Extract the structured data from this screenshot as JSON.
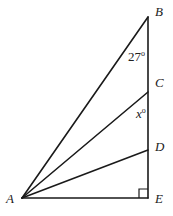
{
  "diagram": {
    "type": "geometry",
    "points": {
      "A": {
        "label": "A",
        "x": 22,
        "y": 198
      },
      "B": {
        "label": "B",
        "x": 148,
        "y": 17
      },
      "C": {
        "label": "C",
        "x": 148,
        "y": 92
      },
      "D": {
        "label": "D",
        "x": 148,
        "y": 150
      },
      "E": {
        "label": "E",
        "x": 148,
        "y": 198
      }
    },
    "segments": [
      {
        "from": "A",
        "to": "B"
      },
      {
        "from": "A",
        "to": "C"
      },
      {
        "from": "A",
        "to": "D"
      },
      {
        "from": "A",
        "to": "E"
      },
      {
        "from": "B",
        "to": "E"
      }
    ],
    "angles": [
      {
        "vertex": "B",
        "value_text": "27",
        "degree_symbol": "o"
      },
      {
        "vertex": "C",
        "value_text": "x",
        "degree_symbol": "o"
      }
    ],
    "right_angle": {
      "vertex": "E"
    },
    "line_color": "#1a1a1a"
  }
}
